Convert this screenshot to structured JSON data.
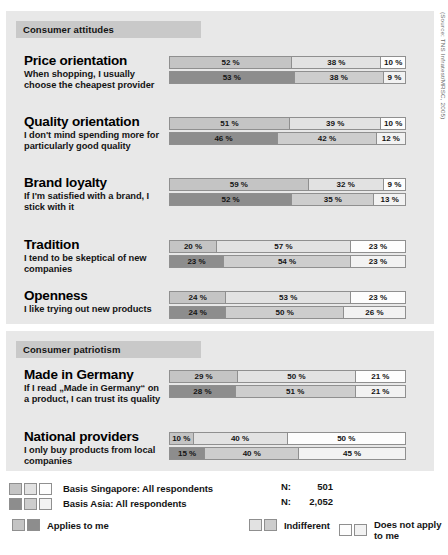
{
  "source_note": "(Source: TNS Infratest/MRSC, 2005)",
  "sections": [
    {
      "header": "Consumer attitudes",
      "rows": [
        {
          "title": "Price orientation",
          "subtitle": "When shopping, I usually choose the cheapest provider",
          "singapore": [
            "52 %",
            "38 %",
            "10 %"
          ],
          "asia": [
            "53 %",
            "38 %",
            "9 %"
          ]
        },
        {
          "title": "Quality orientation",
          "subtitle": "I don't mind spending more for particularly good quality",
          "singapore": [
            "51 %",
            "39 %",
            "10 %"
          ],
          "asia": [
            "46 %",
            "42 %",
            "12 %"
          ]
        },
        {
          "title": "Brand loyalty",
          "subtitle": "If I'm satisfied with a brand, I stick with it",
          "singapore": [
            "59 %",
            "32 %",
            "9 %"
          ],
          "asia": [
            "52 %",
            "35 %",
            "13 %"
          ]
        },
        {
          "title": "Tradition",
          "subtitle": "I tend to be skeptical of new companies",
          "singapore": [
            "20 %",
            "57 %",
            "23 %"
          ],
          "asia": [
            "23 %",
            "54 %",
            "23 %"
          ]
        },
        {
          "title": "Openness",
          "subtitle": "I like trying out new products",
          "singapore": [
            "24 %",
            "53 %",
            "23 %"
          ],
          "asia": [
            "24 %",
            "50 %",
            "26 %"
          ]
        }
      ]
    },
    {
      "header": "Consumer patriotism",
      "rows": [
        {
          "title": "Made in Germany",
          "subtitle": "If I read „Made in Germany“ on a product, I can trust its quality",
          "singapore": [
            "29 %",
            "50 %",
            "21 %"
          ],
          "asia": [
            "28 %",
            "51 %",
            "21 %"
          ]
        },
        {
          "title": "National providers",
          "subtitle": "I only buy products from local companies",
          "singapore": [
            "10 %",
            "40 %",
            "50 %"
          ],
          "asia": [
            "15 %",
            "40 %",
            "45 %"
          ]
        }
      ]
    }
  ],
  "legend": {
    "basis": [
      {
        "label": "Basis Singapore: All respondents",
        "n_label": "N:",
        "n_value": "501"
      },
      {
        "label": "Basis Asia: All respondents",
        "n_label": "N:",
        "n_value": "2,052"
      }
    ],
    "categories": [
      {
        "label": "Applies to me"
      },
      {
        "label": "Indifferent"
      },
      {
        "label": "Does not apply to me"
      }
    ]
  },
  "chart_data": {
    "type": "bar",
    "subtitle": "",
    "orientation": "horizontal",
    "stacked": true,
    "stack_total": 100,
    "unit": "%",
    "xlabel": "",
    "ylabel": "",
    "xlim": [
      0,
      100
    ],
    "grid": false,
    "legend_position": "bottom",
    "categories_segments": [
      "Applies to me",
      "Indifferent",
      "Does not apply to me"
    ],
    "series": [
      {
        "name": "Basis Singapore: All respondents",
        "n": 501
      },
      {
        "name": "Basis Asia: All respondents",
        "n": 2052
      }
    ],
    "groups": [
      {
        "group": "Consumer attitudes",
        "items": [
          {
            "category": "Price orientation",
            "statement": "When shopping, I usually choose the cheapest provider",
            "Singapore": [
              52,
              38,
              10
            ],
            "Asia": [
              53,
              38,
              9
            ]
          },
          {
            "category": "Quality orientation",
            "statement": "I don't mind spending more for particularly good quality",
            "Singapore": [
              51,
              39,
              10
            ],
            "Asia": [
              46,
              42,
              12
            ]
          },
          {
            "category": "Brand loyalty",
            "statement": "If I'm satisfied with a brand, I stick with it",
            "Singapore": [
              59,
              32,
              9
            ],
            "Asia": [
              52,
              35,
              13
            ]
          },
          {
            "category": "Tradition",
            "statement": "I tend to be skeptical of new companies",
            "Singapore": [
              20,
              57,
              23
            ],
            "Asia": [
              23,
              54,
              23
            ]
          },
          {
            "category": "Openness",
            "statement": "I like trying out new products",
            "Singapore": [
              24,
              53,
              23
            ],
            "Asia": [
              24,
              50,
              26
            ]
          }
        ]
      },
      {
        "group": "Consumer patriotism",
        "items": [
          {
            "category": "Made in Germany",
            "statement": "If I read „Made in Germany“ on a product, I can trust its quality",
            "Singapore": [
              29,
              50,
              21
            ],
            "Asia": [
              28,
              51,
              21
            ]
          },
          {
            "category": "National providers",
            "statement": "I only buy products from local companies",
            "Singapore": [
              10,
              40,
              50
            ],
            "Asia": [
              15,
              40,
              45
            ]
          }
        ]
      }
    ],
    "annotation": "(Source: TNS Infratest/MRSC, 2005)"
  },
  "colors": {
    "panel_bg": "#e8e8e8",
    "header_bg": "#c9c9c9",
    "border": "#8f8f8f",
    "sg_applies": "#c4c4c4",
    "sg_indifferent": "#e2e2e2",
    "sg_not_apply": "#fdfdfd",
    "asia_applies": "#8d8d8d",
    "asia_indifferent": "#cdcdcd",
    "asia_not_apply": "#f2f2f2"
  }
}
